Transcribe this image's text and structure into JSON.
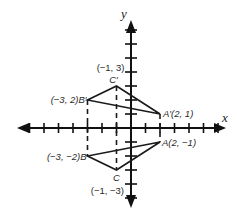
{
  "diagram": {
    "type": "coordinate-plane-reflection",
    "axes": {
      "x_label": "x",
      "y_label": "y",
      "origin_px": [
        131,
        128
      ],
      "unit_px_x": 14.5,
      "unit_px_y": 14,
      "x_ticks": [
        -7,
        -6,
        -5,
        -4,
        -3,
        -2,
        -1,
        1,
        2,
        3,
        4,
        5,
        6
      ],
      "y_ticks": [
        -5,
        -4,
        -3,
        -2,
        -1,
        1,
        2,
        3,
        4,
        5,
        6,
        7
      ],
      "color": "#111111"
    },
    "triangles": [
      {
        "name": "image",
        "vertices": [
          {
            "id": "A'",
            "x": 2,
            "y": 1,
            "label": "A′(2, 1)"
          },
          {
            "id": "B'",
            "x": -3,
            "y": 2,
            "label": "(−3, 2)B′"
          },
          {
            "id": "C'",
            "x": -1,
            "y": 3,
            "label": "C′",
            "coord_label": "(−1, 3)"
          }
        ]
      },
      {
        "name": "original",
        "vertices": [
          {
            "id": "A",
            "x": 2,
            "y": -1,
            "label": "A(2, −1)"
          },
          {
            "id": "B",
            "x": -3,
            "y": -2,
            "label": "(−3, −2)B"
          },
          {
            "id": "C",
            "x": -1,
            "y": -3,
            "label": "C",
            "coord_label": "(−1, −3)"
          }
        ]
      }
    ],
    "dashed_connectors": [
      {
        "from": "B'",
        "to": "B"
      },
      {
        "from": "C'",
        "to": "C"
      },
      {
        "from": "A'",
        "to": "A"
      }
    ],
    "line_color": "#1a1a1a"
  }
}
